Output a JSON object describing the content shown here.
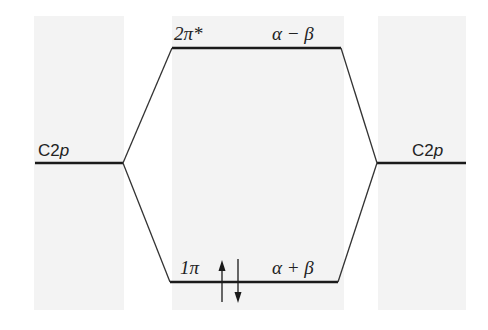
{
  "diagram": {
    "type": "molecular-orbital-diagram",
    "left_atomic_orbital": {
      "label_prefix": "C2",
      "label_italic": "p"
    },
    "right_atomic_orbital": {
      "label_prefix": "C2",
      "label_italic": "p"
    },
    "upper_molecular_orbital": {
      "name": "2π*",
      "energy": "α − β"
    },
    "lower_molecular_orbital": {
      "name": "1π",
      "energy": "α + β",
      "electrons": [
        "spin-up",
        "spin-down"
      ]
    },
    "colors": {
      "line": "#1a1a1a",
      "panel": "#f3f3f3",
      "background": "#ffffff"
    }
  }
}
